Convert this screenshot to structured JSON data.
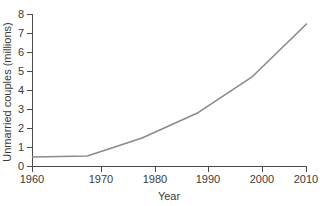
{
  "chart_data": {
    "type": "line",
    "title": "",
    "xlabel": "Year",
    "ylabel": "Unmarried couples (millions)",
    "x": [
      1960,
      1970,
      1980,
      1990,
      2000,
      2010
    ],
    "values": [
      0.5,
      0.55,
      1.5,
      2.8,
      4.7,
      7.5
    ],
    "series": [
      {
        "name": "Unmarried couples",
        "values": [
          0.5,
          0.55,
          1.5,
          2.8,
          4.7,
          7.5
        ],
        "color": "#8a8a8a"
      }
    ],
    "xlim": [
      1960,
      2010
    ],
    "ylim": [
      0,
      8
    ],
    "xticks": [
      1960,
      1970,
      1980,
      1990,
      2000,
      2010
    ],
    "xticklabels": [
      "1960",
      "1970",
      "1980",
      "1990",
      "2000",
      "2010"
    ],
    "yticks": [
      0,
      1,
      2,
      3,
      4,
      5,
      6,
      7,
      8
    ],
    "yticklabels": [
      "0",
      "1",
      "2",
      "3",
      "4",
      "5",
      "6",
      "7",
      "8"
    ],
    "grid": false,
    "legend": "none",
    "background": "#ffffff",
    "axis_color": "#4a4a4a"
  },
  "axes": {
    "y_title": "Unmarried couples (millions)",
    "x_title": "Year",
    "y_ticks": [
      {
        "label": "8",
        "value": 8
      },
      {
        "label": "7",
        "value": 7
      },
      {
        "label": "6",
        "value": 6
      },
      {
        "label": "5",
        "value": 5
      },
      {
        "label": "4",
        "value": 4
      },
      {
        "label": "3",
        "value": 3
      },
      {
        "label": "2",
        "value": 2
      },
      {
        "label": "1",
        "value": 1
      },
      {
        "label": "0",
        "value": 0
      }
    ],
    "x_ticks": [
      {
        "label": "1960",
        "value": 1960
      },
      {
        "label": "1970",
        "value": 1970
      },
      {
        "label": "1980",
        "value": 1980
      },
      {
        "label": "1990",
        "value": 1990
      },
      {
        "label": "2000",
        "value": 2000
      },
      {
        "label": "2010",
        "value": 2010
      }
    ]
  }
}
